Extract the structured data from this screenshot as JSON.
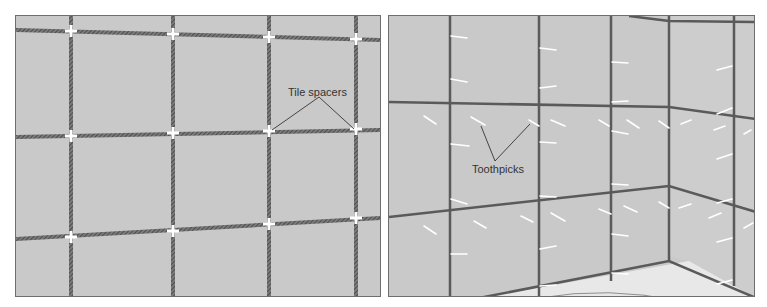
{
  "figure": {
    "panels": [
      {
        "id": "left",
        "title": "Tile spacers illustration",
        "callout": "Tile spacers"
      },
      {
        "id": "right",
        "title": "Toothpicks illustration",
        "callout": "Toothpicks"
      }
    ],
    "colors": {
      "tile": "#c9c9c9",
      "grout": "#555555",
      "spacer": "#ffffff",
      "floor": "#e6e6e6",
      "frame": "#6e6e6e"
    }
  }
}
